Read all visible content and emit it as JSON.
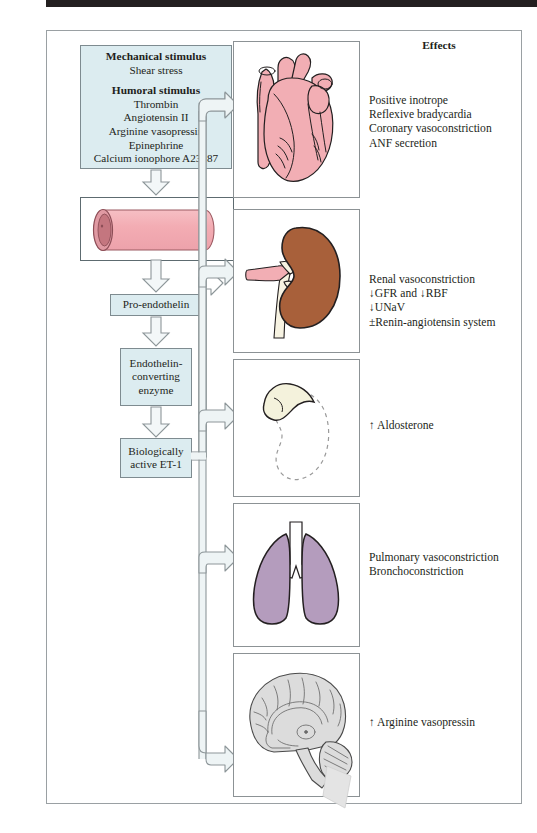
{
  "figure": {
    "effects_header": "Effects"
  },
  "stimulus_box": {
    "mechanical_header": "Mechanical stimulus",
    "mechanical_items": [
      "Shear stress"
    ],
    "humoral_header": "Humoral stimulus",
    "humoral_items": [
      "Thrombin",
      "Angiotensin II",
      "Arginine vasopressin",
      "Epinephrine",
      "Calcium ionophore A23187"
    ]
  },
  "pathway": {
    "vessel_label": "blood-vessel-illustration",
    "steps": [
      {
        "id": "pro-endothelin",
        "label": "Pro-endothelin"
      },
      {
        "id": "ece",
        "label": "Endothelin-\nconverting\nenzyme"
      },
      {
        "id": "et1",
        "label": "Biologically\nactive ET-1"
      }
    ]
  },
  "organs": [
    {
      "id": "heart",
      "name": "heart",
      "color": "#f2aeb4",
      "effects": [
        "Positive inotrope",
        "Reflexive bradycardia",
        "Coronary vasoconstriction",
        "ANF secretion"
      ]
    },
    {
      "id": "kidney",
      "name": "kidney",
      "color": "#a8603a",
      "effects": [
        "Renal vasoconstriction",
        "↓GFR and ↓RBF",
        "↓UNaV",
        "±Renin-angiotensin system"
      ]
    },
    {
      "id": "adrenal",
      "name": "adrenal-gland",
      "color": "#f4f2dc",
      "effects": [
        "↑ Aldosterone"
      ]
    },
    {
      "id": "lung",
      "name": "lungs",
      "color": "#b49cbd",
      "effects": [
        "Pulmonary vasoconstriction",
        "Bronchoconstriction"
      ]
    },
    {
      "id": "brain",
      "name": "brain",
      "color": "#dcdcdc",
      "effects": [
        "↑ Arginine vasopressin"
      ]
    }
  ],
  "colors": {
    "box_fill": "#dcecf0",
    "box_stroke": "#7e8b90",
    "frame_stroke": "#9aa0a3",
    "arrow_stroke": "#8d9699",
    "arrow_fill": "#eef4f5",
    "text": "#231f20"
  }
}
